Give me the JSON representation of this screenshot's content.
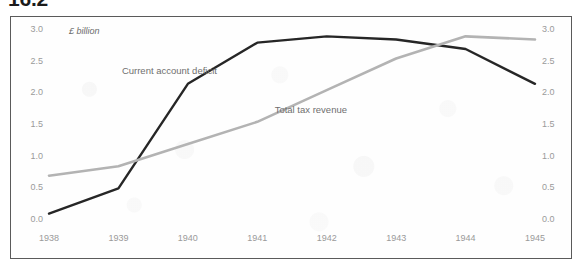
{
  "figure": {
    "number": "16.2"
  },
  "chart_data": {
    "type": "line",
    "title": "16.2",
    "unit_label": "£ billion",
    "xlabel": "",
    "ylabel": "£ billion",
    "x": [
      1938,
      1939,
      1940,
      1941,
      1942,
      1943,
      1944,
      1945
    ],
    "xtick_labels": [
      "1938",
      "1939",
      "1940",
      "1941",
      "1942",
      "1943",
      "1944",
      "1945"
    ],
    "ylim": [
      0.0,
      3.0
    ],
    "ytick_values": [
      0.0,
      0.5,
      1.0,
      1.5,
      2.0,
      2.5,
      3.0
    ],
    "ytick_labels": [
      "0.0",
      "0.5",
      "1.0",
      "1.5",
      "2.0",
      "2.5",
      "3.0"
    ],
    "dual_axis": true,
    "right_ytick_labels": [
      "0.0",
      "0.5",
      "1.0",
      "1.5",
      "2.0",
      "2.5",
      "3.0"
    ],
    "grid": false,
    "legend": "inline-annotations",
    "series": [
      {
        "name": "Current account deficit",
        "color": "#262626",
        "values": [
          0.1,
          0.5,
          2.15,
          2.8,
          2.9,
          2.85,
          2.7,
          2.15
        ],
        "label_x": 1939.05,
        "label_y": 2.33
      },
      {
        "name": "Total tax revenue",
        "color": "#b3b3b3",
        "values": [
          0.7,
          0.85,
          1.2,
          1.55,
          2.05,
          2.55,
          2.9,
          2.85
        ],
        "label_x": 1941.25,
        "label_y": 1.72
      }
    ]
  },
  "colors": {
    "frame_border": "#5a5a5a",
    "tick_text": "#9a9a9a",
    "annotation_text": "#6f6f6f",
    "background": "#fefefe"
  }
}
